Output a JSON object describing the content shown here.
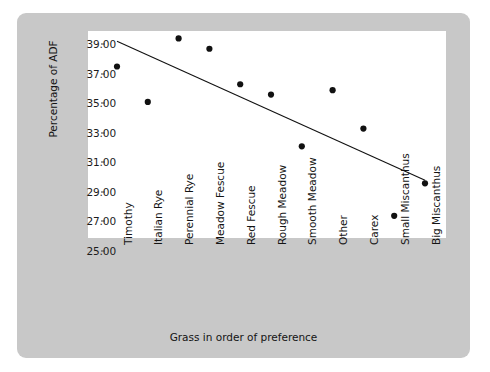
{
  "chart_data": {
    "type": "scatter",
    "title": "",
    "xlabel": "Grass in order of preference",
    "ylabel": "Percentage of ADF",
    "categories": [
      "Timothy",
      "Italian Rye",
      "Perennial Rye",
      "Meadow Fescue",
      "Red Fescue",
      "Rough Meadow",
      "Smooth Meadow",
      "Other",
      "Carex",
      "Small Miscanthus",
      "Big Miscanthus"
    ],
    "values": [
      36.6,
      34.2,
      38.5,
      37.8,
      35.4,
      34.7,
      31.2,
      35.0,
      32.4,
      26.5,
      28.7
    ],
    "ylim": [
      25.0,
      39.0
    ],
    "yticks": [
      39.0,
      37.0,
      35.0,
      33.0,
      31.0,
      29.0,
      27.0,
      25.0
    ],
    "ytick_labels": [
      "39.00",
      "37.00",
      "35.00",
      "33.00",
      "31.00",
      "29.00",
      "27.00",
      "25.00"
    ],
    "grid": false,
    "legend": null,
    "trendline": {
      "type": "linear",
      "x_start_category": "Timothy",
      "x_end_category": "Big Miscanthus",
      "y_start": 38.3,
      "y_end": 28.9
    },
    "marker": {
      "shape": "circle",
      "color": "#111111",
      "radius": 3.1
    },
    "colors": {
      "panel_background": "#c8c8c8",
      "plot_background": "#ffffff",
      "page_background": "#ffffff",
      "text": "#141414",
      "line": "#111111"
    }
  }
}
